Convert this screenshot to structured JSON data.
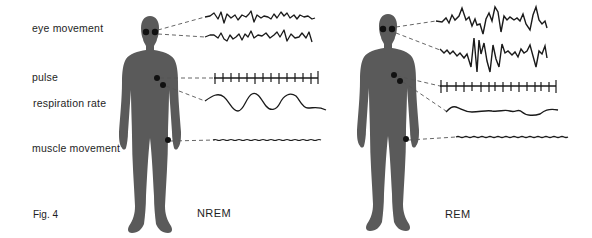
{
  "figure": {
    "caption": "Fig. 4",
    "labels": {
      "eye_movement": "eye movement",
      "pulse": "pulse",
      "respiration_rate": "respiration rate",
      "muscle_movement": "muscle movement"
    },
    "panels": [
      {
        "state": "NREM",
        "description": "Regular, low-amplitude eye movement traces; steady pulse; regular large-wave respiration; low steady muscle tone"
      },
      {
        "state": "REM",
        "description": "Irregular, high-amplitude eye movement traces; slightly irregular pulse; irregular shallow respiration; low muscle tone"
      }
    ],
    "colors": {
      "silhouette": "#5a5a5a",
      "sensor_dot": "#111111",
      "trace": "#1a1a1a",
      "leader_line": "#555555",
      "background": "#ffffff"
    }
  }
}
